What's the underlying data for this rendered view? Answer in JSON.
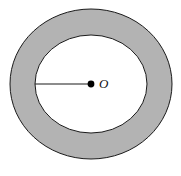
{
  "figure": {
    "type": "annulus-diagram",
    "title": "",
    "background_color": "#ffffff",
    "shapes": {
      "outer_circle": {
        "name": "outer-circle",
        "center_x": 91,
        "center_y": 84,
        "radius_x": 81,
        "radius_y": 75,
        "fill_color": "#b3b3b3",
        "stroke_color": "#1a1a1a",
        "stroke_width": 1
      },
      "inner_circle": {
        "name": "inner-circle",
        "center_x": 91,
        "center_y": 84,
        "radius_x": 56,
        "radius_y": 49,
        "fill_color": "#ffffff",
        "stroke_color": "#1a1a1a",
        "stroke_width": 1
      },
      "radius_segment": {
        "name": "radius-line",
        "x1": 35,
        "y1": 84,
        "x2": 91,
        "y2": 84,
        "stroke_color": "#1a1a1a",
        "stroke_width": 1.2
      },
      "center_point": {
        "name": "center-dot",
        "cx": 91,
        "cy": 84,
        "r": 3.4,
        "fill_color": "#000000"
      }
    },
    "labels": {
      "center_label": "O"
    }
  }
}
